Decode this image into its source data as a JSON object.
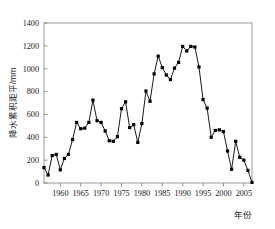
{
  "chart_data": {
    "type": "line",
    "title": "",
    "subtitle": "",
    "xlabel": "年份",
    "ylabel": "降水累积距平/mm",
    "xlim": [
      1956,
      2007
    ],
    "ylim": [
      0,
      1400
    ],
    "grid": false,
    "legend": null,
    "marker": "filled-square",
    "line_color": "#000000",
    "marker_color": "#000000",
    "frame_color": "#999999",
    "x_ticks": [
      1960,
      1965,
      1970,
      1975,
      1980,
      1985,
      1990,
      1995,
      2000,
      2005
    ],
    "y_ticks": [
      0,
      200,
      400,
      600,
      800,
      1000,
      1200,
      1400
    ],
    "x_tick_labels": [
      "1960",
      "1965",
      "1970",
      "1975",
      "1980",
      "1985",
      "1990",
      "1995",
      "2000",
      "2005"
    ],
    "y_tick_labels": [
      "0",
      "200",
      "400",
      "600",
      "800",
      "1000",
      "1200",
      "1400"
    ],
    "x": [
      1956,
      1957,
      1958,
      1959,
      1960,
      1961,
      1962,
      1963,
      1964,
      1965,
      1966,
      1967,
      1968,
      1969,
      1970,
      1971,
      1972,
      1973,
      1974,
      1975,
      1976,
      1977,
      1978,
      1979,
      1980,
      1981,
      1982,
      1983,
      1984,
      1985,
      1986,
      1987,
      1988,
      1989,
      1990,
      1991,
      1992,
      1993,
      1994,
      1995,
      1996,
      1997,
      1998,
      1999,
      2000,
      2001,
      2002,
      2003,
      2004,
      2005,
      2006,
      2007
    ],
    "values": [
      135,
      70,
      240,
      250,
      115,
      215,
      250,
      380,
      530,
      475,
      480,
      530,
      725,
      545,
      530,
      455,
      370,
      365,
      405,
      650,
      710,
      485,
      510,
      355,
      520,
      805,
      715,
      955,
      1110,
      1010,
      945,
      905,
      1005,
      1055,
      1195,
      1155,
      1195,
      1190,
      1015,
      730,
      655,
      400,
      460,
      465,
      450,
      280,
      120,
      365,
      225,
      200,
      110,
      5
    ],
    "series": [
      {
        "name": "降水累积距平",
        "values": [
          135,
          70,
          240,
          250,
          115,
          215,
          250,
          380,
          530,
          475,
          480,
          530,
          725,
          545,
          530,
          455,
          370,
          365,
          405,
          650,
          710,
          485,
          510,
          355,
          520,
          805,
          715,
          955,
          1110,
          1010,
          945,
          905,
          1005,
          1055,
          1195,
          1155,
          1195,
          1190,
          1015,
          730,
          655,
          400,
          460,
          465,
          450,
          280,
          120,
          365,
          225,
          200,
          110,
          5
        ]
      }
    ]
  }
}
